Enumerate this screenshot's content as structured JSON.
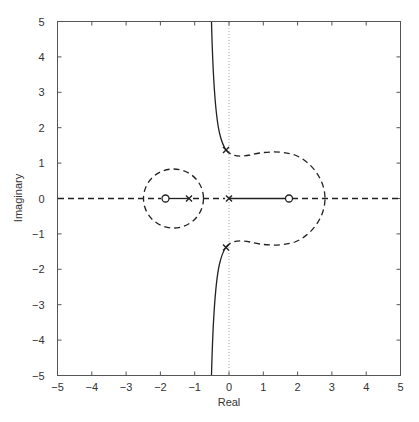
{
  "chart_data": {
    "type": "line",
    "subtype": "root-locus",
    "title": "",
    "xlabel": "Real",
    "ylabel": "Imaginary",
    "xlim": [
      -5,
      5
    ],
    "ylim": [
      -5,
      5
    ],
    "xticks": [
      -5,
      -4,
      -3,
      -2,
      -1,
      0,
      1,
      2,
      3,
      4,
      5
    ],
    "yticks": [
      -5,
      -4,
      -3,
      -2,
      -1,
      0,
      1,
      2,
      3,
      4,
      5
    ],
    "grid": false,
    "legend": null,
    "poles": [
      {
        "re": -1.15,
        "im": 0
      },
      {
        "re": 0,
        "im": 0
      },
      {
        "re": -0.08,
        "im": 1.35
      },
      {
        "re": -0.08,
        "im": -1.35
      }
    ],
    "zeros": [
      {
        "re": -1.8,
        "im": 0
      },
      {
        "re": 1.75,
        "im": 0
      }
    ],
    "series": [
      {
        "name": "positive-gain locus (solid)",
        "style": "solid",
        "branches": [
          [
            [
              -0.55,
              5
            ],
            [
              -0.5,
              3.5
            ],
            [
              -0.42,
              2.5
            ],
            [
              -0.25,
              1.7
            ],
            [
              -0.08,
              1.35
            ]
          ],
          [
            [
              -0.55,
              -5
            ],
            [
              -0.5,
              -3.5
            ],
            [
              -0.42,
              -2.5
            ],
            [
              -0.25,
              -1.7
            ],
            [
              -0.08,
              -1.35
            ]
          ],
          [
            [
              -1.8,
              0
            ],
            [
              -1.15,
              0
            ]
          ],
          [
            [
              0,
              0
            ],
            [
              1.75,
              0
            ]
          ]
        ]
      },
      {
        "name": "negative-gain locus (dashed)",
        "style": "dashed",
        "branches": [
          "circle centered (-1.62, 0) radius 0.87 through (-2.5,0) and (-0.75,0)",
          [
            [
              -0.08,
              1.35
            ],
            [
              0.2,
              1.2
            ],
            [
              1.3,
              1.25
            ],
            [
              2.4,
              0.9
            ],
            [
              2.8,
              0
            ]
          ],
          [
            [
              -0.08,
              -1.35
            ],
            [
              0.2,
              -1.2
            ],
            [
              1.3,
              -1.25
            ],
            [
              2.4,
              -0.9
            ],
            [
              2.8,
              0
            ]
          ],
          [
            [
              -5,
              0
            ],
            [
              -1.8,
              0
            ]
          ],
          [
            [
              1.75,
              0
            ],
            [
              5,
              0
            ]
          ]
        ]
      }
    ],
    "reference_lines": [
      {
        "axis": "x",
        "value": 0,
        "style": "dotted"
      }
    ]
  }
}
